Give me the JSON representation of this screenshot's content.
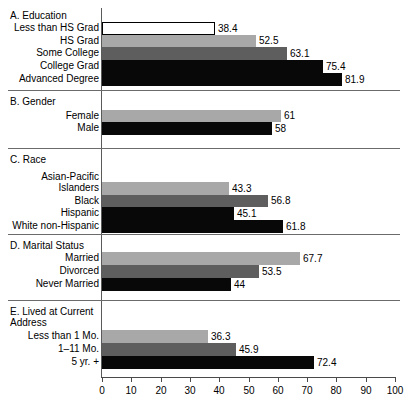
{
  "chart_data": {
    "type": "bar",
    "orientation": "horizontal",
    "title": "",
    "xlabel": "",
    "ylabel": "",
    "xlim": [
      0,
      100
    ],
    "grid": false,
    "legend": null,
    "axis_ticks": [
      0,
      10,
      20,
      30,
      40,
      50,
      60,
      70,
      80,
      90,
      100
    ],
    "panels": [
      {
        "id": "A",
        "title": "A. Education",
        "categories": [
          "Less than HS Grad",
          "HS Grad",
          "Some College",
          "College Grad",
          "Advanced Degree"
        ],
        "values": [
          38.4,
          52.5,
          63.1,
          75.4,
          81.9
        ],
        "value_labels": [
          "38.4",
          "52.5",
          "63.1",
          "75.4",
          "81.9"
        ],
        "fills": [
          "white",
          "light",
          "mid",
          "dark",
          "dark"
        ]
      },
      {
        "id": "B",
        "title": "B. Gender",
        "categories": [
          "Female",
          "Male"
        ],
        "values": [
          61,
          58
        ],
        "value_labels": [
          "61",
          "58"
        ],
        "fills": [
          "light",
          "dark"
        ]
      },
      {
        "id": "C",
        "title": "C. Race",
        "categories": [
          "Asian-Pacific\nIslanders",
          "Black",
          "Hispanic",
          "White non-Hispanic"
        ],
        "values": [
          43.3,
          56.8,
          45.1,
          61.8
        ],
        "value_labels": [
          "43.3",
          "56.8",
          "45.1",
          "61.8"
        ],
        "fills": [
          "light",
          "mid",
          "dark",
          "dark"
        ]
      },
      {
        "id": "D",
        "title": "D. Marital Status",
        "categories": [
          "Married",
          "Divorced",
          "Never Married"
        ],
        "values": [
          67.7,
          53.5,
          44
        ],
        "value_labels": [
          "67.7",
          "53.5",
          "44"
        ],
        "fills": [
          "light",
          "mid",
          "dark"
        ]
      },
      {
        "id": "E",
        "title": "E. Lived at Current\n    Address",
        "categories": [
          "Less than 1 Mo.",
          "1–11 Mo.",
          "5 yr. +"
        ],
        "values": [
          36.3,
          45.9,
          72.4
        ],
        "value_labels": [
          "36.3",
          "45.9",
          "72.4"
        ],
        "fills": [
          "light",
          "mid",
          "dark"
        ]
      }
    ],
    "colors": {
      "white": "#ffffff",
      "light": "#a8a8a8",
      "mid": "#5e5e5e",
      "dark": "#080808",
      "axis": "#4a4a4a",
      "rule": "#6b6b6b"
    }
  },
  "layout": {
    "panel_tops": [
      8,
      94,
      152,
      238,
      304
    ],
    "panel_rule_ys": [
      90,
      148,
      234,
      300
    ],
    "axis_x0": 102,
    "axis_x100": 395,
    "bar_rows": {
      "A": [
        {
          "top": 22,
          "h": 13
        },
        {
          "top": 35,
          "h": 12
        },
        {
          "top": 47,
          "h": 13
        },
        {
          "top": 60,
          "h": 13
        },
        {
          "top": 73,
          "h": 13
        }
      ],
      "B": [
        {
          "top": 110,
          "h": 12
        },
        {
          "top": 122,
          "h": 13
        }
      ],
      "C": [
        {
          "top": 182,
          "h": 13
        },
        {
          "top": 195,
          "h": 12
        },
        {
          "top": 207,
          "h": 13
        },
        {
          "top": 220,
          "h": 13
        }
      ],
      "D": [
        {
          "top": 252,
          "h": 13
        },
        {
          "top": 265,
          "h": 13
        },
        {
          "top": 278,
          "h": 13
        }
      ],
      "E": [
        {
          "top": 330,
          "h": 13
        },
        {
          "top": 343,
          "h": 13
        },
        {
          "top": 356,
          "h": 13
        }
      ]
    },
    "title_tops": {
      "A": 10,
      "B": 96,
      "C": 154,
      "D": 240,
      "E": 306
    },
    "label_tops": {
      "A": [
        22,
        35,
        47,
        60,
        73
      ],
      "B": [
        110,
        122
      ],
      "C": [
        171,
        195,
        207,
        220
      ],
      "D": [
        252,
        265,
        278
      ],
      "E": [
        330,
        343,
        356
      ]
    }
  }
}
